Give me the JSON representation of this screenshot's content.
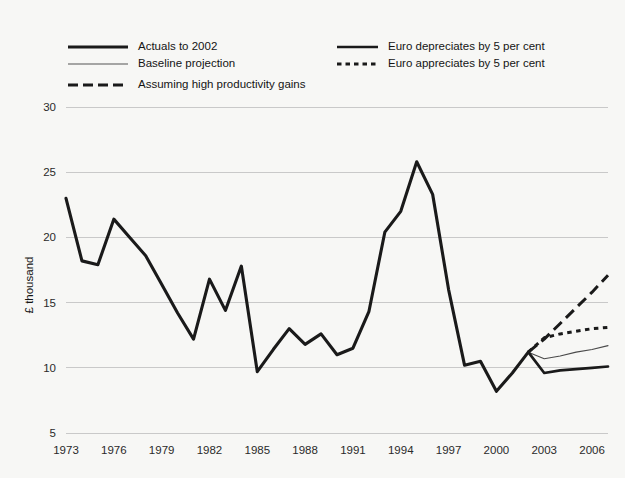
{
  "chart_data": {
    "type": "line",
    "title": "",
    "subtitle": "",
    "xlabel": "",
    "ylabel": "£ thousand",
    "ylim": [
      5,
      30
    ],
    "xlim": [
      1973,
      2007
    ],
    "grid": true,
    "y_ticks": [
      "5",
      "10",
      "15",
      "20",
      "25",
      "30"
    ],
    "y_tick_values": [
      5,
      10,
      15,
      20,
      25,
      30
    ],
    "x_ticks": [
      "1973",
      "1976",
      "1979",
      "1982",
      "1985",
      "1988",
      "1991",
      "1994",
      "1997",
      "2000",
      "2003",
      "2006"
    ],
    "x_tick_values": [
      1973,
      1976,
      1979,
      1982,
      1985,
      1988,
      1991,
      1994,
      1997,
      2000,
      2003,
      2006
    ],
    "legend_position": "top",
    "series": [
      {
        "name": "Actuals to 2002",
        "style": "thick-solid",
        "x": [
          1973,
          1974,
          1975,
          1976,
          1977,
          1978,
          1979,
          1980,
          1981,
          1982,
          1983,
          1984,
          1985,
          1986,
          1987,
          1988,
          1989,
          1990,
          1991,
          1992,
          1993,
          1994,
          1995,
          1996,
          1997,
          1998,
          1999,
          2000,
          2001,
          2002
        ],
        "values": [
          23.0,
          18.2,
          17.9,
          21.4,
          20.0,
          18.6,
          16.4,
          14.2,
          12.2,
          16.8,
          14.4,
          17.8,
          9.7,
          11.4,
          13.0,
          11.8,
          12.6,
          11.0,
          11.5,
          14.3,
          20.4,
          22.0,
          25.8,
          23.3,
          16.0,
          10.2,
          10.5,
          8.2,
          9.6,
          11.2
        ]
      },
      {
        "name": "Baseline projection",
        "style": "thin-solid",
        "x": [
          2002,
          2003,
          2004,
          2005,
          2006,
          2007
        ],
        "values": [
          11.2,
          10.7,
          10.9,
          11.2,
          11.4,
          11.7
        ]
      },
      {
        "name": "Assuming high productivity gains",
        "style": "long-dash",
        "x": [
          2002,
          2003,
          2004,
          2005,
          2006,
          2007
        ],
        "values": [
          11.2,
          12.2,
          13.4,
          14.6,
          15.8,
          17.1
        ]
      },
      {
        "name": "Euro depreciates by 5 per cent",
        "style": "medium-solid",
        "x": [
          2002,
          2003,
          2004,
          2005,
          2006,
          2007
        ],
        "values": [
          11.2,
          9.6,
          9.8,
          9.9,
          10.0,
          10.1
        ]
      },
      {
        "name": "Euro appreciates by 5 per cent",
        "style": "dotted",
        "x": [
          2002,
          2003,
          2004,
          2005,
          2006,
          2007
        ],
        "values": [
          11.2,
          12.3,
          12.6,
          12.8,
          13.0,
          13.1
        ]
      }
    ]
  },
  "legend": {
    "entries": [
      {
        "label": "Actuals to 2002",
        "style": "thick-solid",
        "col": 0,
        "row": 0
      },
      {
        "label": "Baseline projection",
        "style": "thin-solid",
        "col": 0,
        "row": 1
      },
      {
        "label": "Assuming high productivity gains",
        "style": "long-dash",
        "col": 0,
        "row": 2
      },
      {
        "label": "Euro depreciates by 5 per cent",
        "style": "medium-solid",
        "col": 1,
        "row": 0
      },
      {
        "label": "Euro appreciates by 5 per cent",
        "style": "dotted",
        "col": 1,
        "row": 1
      }
    ]
  },
  "colors": {
    "background": "#f7f7f5",
    "line": "#1a1a1a",
    "grid": "#c9c9c9",
    "text": "#141414"
  }
}
